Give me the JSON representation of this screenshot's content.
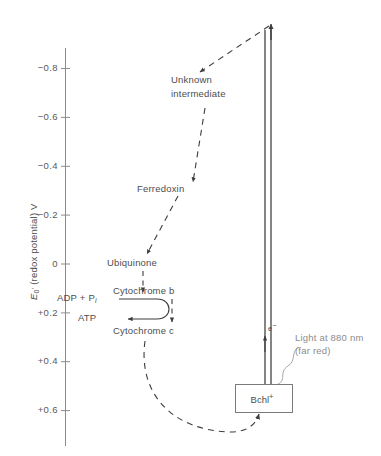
{
  "figure": {
    "type": "diagram",
    "axis": {
      "title": "E₀' (redox potential)  V",
      "title_parts": {
        "symbol": "E",
        "sub": "0",
        "prime": "'",
        "rest": "(redox potential)  V"
      },
      "ticks": [
        {
          "label": "−0.8",
          "value": -0.8
        },
        {
          "label": "−0.6",
          "value": -0.6
        },
        {
          "label": "−0.4",
          "value": -0.4
        },
        {
          "label": "−0.2",
          "value": -0.2
        },
        {
          "label": "0",
          "value": 0.0
        },
        {
          "label": "+0.2",
          "value": 0.2
        },
        {
          "label": "+0.4",
          "value": 0.4
        },
        {
          "label": "+0.6",
          "value": 0.6
        }
      ],
      "range": [
        -0.9,
        0.68
      ]
    },
    "nodes": [
      {
        "id": "unknown-intermediate",
        "line1": "Unknown",
        "line2": "intermediate",
        "value": -0.72
      },
      {
        "id": "ferredoxin",
        "label": "Ferredoxin",
        "value": -0.33
      },
      {
        "id": "ubiquinone",
        "label": "Ubiquinone",
        "value": -0.05
      },
      {
        "id": "cytochrome-b",
        "label": "Cytochrome b",
        "value": 0.12
      },
      {
        "id": "cytochrome-c",
        "label": "Cytochrome c",
        "value": 0.26
      },
      {
        "id": "bchl",
        "label": "Bchl",
        "charge": "+",
        "value": 0.52
      }
    ],
    "phosphorylation": {
      "substrate": "ADP + P",
      "substrate_sub": "i",
      "product": "ATP"
    },
    "light": {
      "line1": "Light at 880 nm",
      "line2": "(far red)"
    },
    "electron": {
      "symbol": "e",
      "charge": "−"
    },
    "colors": {
      "axis": "#8c8c8c",
      "text": "#4d4d4d",
      "light_text": "#8c8c8c",
      "solid_line": "#333333",
      "dashed_line": "#3d3d3d",
      "box_border": "#7a7a7a"
    }
  }
}
